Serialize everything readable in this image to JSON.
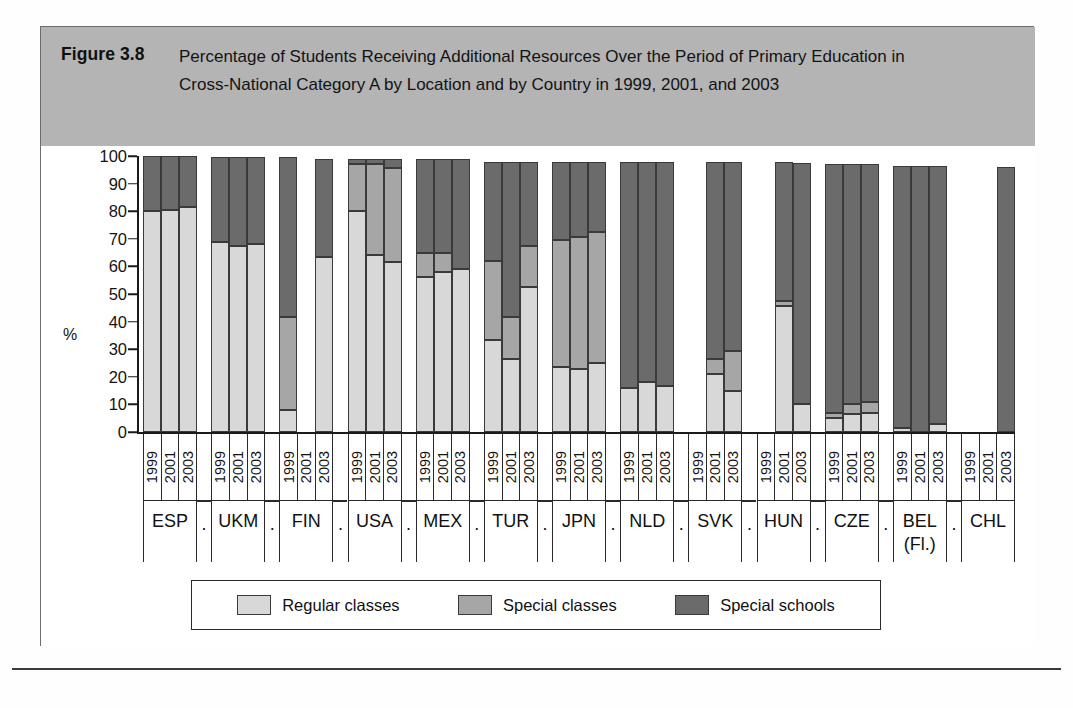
{
  "figure": {
    "number": "Figure 3.8",
    "title": "Percentage of Students Receiving Additional Resources Over the Period of Primary Education in Cross-National Category A by Location and by Country in 1999, 2001, and 2003",
    "y_axis_unit": "%"
  },
  "legend": {
    "items": [
      {
        "label": "Regular classes",
        "color": "#d8d8d8",
        "key": "regular"
      },
      {
        "label": "Special classes",
        "color": "#a6a6a6",
        "key": "special_classes"
      },
      {
        "label": "Special schools",
        "color": "#6b6b6b",
        "key": "special_schools"
      }
    ]
  },
  "spacer_label": ".",
  "chart_data": {
    "type": "bar",
    "subtype": "stacked-percentage",
    "title": "Percentage of Students Receiving Additional Resources Over the Period of Primary Education in Cross-National Category A by Location and by Country in 1999, 2001, and 2003",
    "xlabel": "",
    "ylabel": "%",
    "ylim": [
      0,
      100
    ],
    "yticks": [
      0,
      10,
      20,
      30,
      40,
      50,
      60,
      70,
      80,
      90,
      100
    ],
    "grid": false,
    "legend_position": "bottom",
    "years": [
      "1999",
      "2001",
      "2003"
    ],
    "series": [
      {
        "name": "Regular classes",
        "color": "#d8d8d8"
      },
      {
        "name": "Special classes",
        "color": "#a6a6a6"
      },
      {
        "name": "Special schools",
        "color": "#6b6b6b"
      }
    ],
    "categories": [
      "ESP",
      "UKM",
      "FIN",
      "USA",
      "MEX",
      "TUR",
      "JPN",
      "NLD",
      "SVK",
      "HUN",
      "CZE",
      "BEL (Fl.)",
      "CHL"
    ],
    "groups": [
      {
        "country": "ESP",
        "country_line1": "ESP",
        "country_line2": "",
        "bars": [
          {
            "year": "1999",
            "present": true,
            "regular": 80.0,
            "special_classes": 0.0,
            "special_schools": 20.0
          },
          {
            "year": "2001",
            "present": true,
            "regular": 80.5,
            "special_classes": 0.0,
            "special_schools": 19.5
          },
          {
            "year": "2003",
            "present": true,
            "regular": 81.5,
            "special_classes": 0.0,
            "special_schools": 18.5
          }
        ]
      },
      {
        "country": "UKM",
        "country_line1": "UKM",
        "country_line2": "",
        "bars": [
          {
            "year": "1999",
            "present": true,
            "regular": 69.0,
            "special_classes": 0.0,
            "special_schools": 30.5
          },
          {
            "year": "2001",
            "present": true,
            "regular": 67.5,
            "special_classes": 0.0,
            "special_schools": 32.0
          },
          {
            "year": "2003",
            "present": true,
            "regular": 68.0,
            "special_classes": 0.0,
            "special_schools": 31.5
          }
        ]
      },
      {
        "country": "FIN",
        "country_line1": "FIN",
        "country_line2": "",
        "bars": [
          {
            "year": "1999",
            "present": true,
            "regular": 8.0,
            "special_classes": 33.5,
            "special_schools": 58.0
          },
          {
            "year": "2001",
            "present": false,
            "regular": 0,
            "special_classes": 0,
            "special_schools": 0
          },
          {
            "year": "2003",
            "present": true,
            "regular": 63.5,
            "special_classes": 0.0,
            "special_schools": 35.5
          }
        ]
      },
      {
        "country": "USA",
        "country_line1": "USA",
        "country_line2": "",
        "bars": [
          {
            "year": "1999",
            "present": true,
            "regular": 80.0,
            "special_classes": 17.0,
            "special_schools": 2.0
          },
          {
            "year": "2001",
            "present": true,
            "regular": 64.0,
            "special_classes": 33.0,
            "special_schools": 2.0
          },
          {
            "year": "2003",
            "present": true,
            "regular": 61.5,
            "special_classes": 34.0,
            "special_schools": 3.5
          }
        ]
      },
      {
        "country": "MEX",
        "country_line1": "MEX",
        "country_line2": "",
        "bars": [
          {
            "year": "1999",
            "present": true,
            "regular": 56.0,
            "special_classes": 9.0,
            "special_schools": 34.0
          },
          {
            "year": "2001",
            "present": true,
            "regular": 58.0,
            "special_classes": 7.0,
            "special_schools": 34.0
          },
          {
            "year": "2003",
            "present": true,
            "regular": 59.0,
            "special_classes": 0.0,
            "special_schools": 40.0
          }
        ]
      },
      {
        "country": "TUR",
        "country_line1": "TUR",
        "country_line2": "",
        "bars": [
          {
            "year": "1999",
            "present": true,
            "regular": 33.5,
            "special_classes": 28.5,
            "special_schools": 36.0
          },
          {
            "year": "2001",
            "present": true,
            "regular": 26.5,
            "special_classes": 15.0,
            "special_schools": 56.5
          },
          {
            "year": "2003",
            "present": true,
            "regular": 52.5,
            "special_classes": 15.0,
            "special_schools": 30.5
          }
        ]
      },
      {
        "country": "JPN",
        "country_line1": "JPN",
        "country_line2": "",
        "bars": [
          {
            "year": "1999",
            "present": true,
            "regular": 23.5,
            "special_classes": 46.0,
            "special_schools": 28.5
          },
          {
            "year": "2001",
            "present": true,
            "regular": 23.0,
            "special_classes": 47.5,
            "special_schools": 27.5
          },
          {
            "year": "2003",
            "present": true,
            "regular": 25.0,
            "special_classes": 47.5,
            "special_schools": 25.5
          }
        ]
      },
      {
        "country": "NLD",
        "country_line1": "NLD",
        "country_line2": "",
        "bars": [
          {
            "year": "1999",
            "present": true,
            "regular": 16.0,
            "special_classes": 0.0,
            "special_schools": 82.0
          },
          {
            "year": "2001",
            "present": true,
            "regular": 18.0,
            "special_classes": 0.0,
            "special_schools": 80.0
          },
          {
            "year": "2003",
            "present": true,
            "regular": 16.5,
            "special_classes": 0.0,
            "special_schools": 81.5
          }
        ]
      },
      {
        "country": "SVK",
        "country_line1": "SVK",
        "country_line2": "",
        "bars": [
          {
            "year": "1999",
            "present": false,
            "regular": 0,
            "special_classes": 0,
            "special_schools": 0
          },
          {
            "year": "2001",
            "present": true,
            "regular": 21.0,
            "special_classes": 5.5,
            "special_schools": 71.5
          },
          {
            "year": "2003",
            "present": true,
            "regular": 15.0,
            "special_classes": 14.5,
            "special_schools": 68.5
          }
        ]
      },
      {
        "country": "HUN",
        "country_line1": "HUN",
        "country_line2": "",
        "bars": [
          {
            "year": "1999",
            "present": false,
            "regular": 0,
            "special_classes": 0,
            "special_schools": 0
          },
          {
            "year": "2001",
            "present": true,
            "regular": 45.5,
            "special_classes": 2.0,
            "special_schools": 50.5
          },
          {
            "year": "2003",
            "present": true,
            "regular": 10.0,
            "special_classes": 0.0,
            "special_schools": 87.5
          }
        ]
      },
      {
        "country": "CZE",
        "country_line1": "CZE",
        "country_line2": "",
        "bars": [
          {
            "year": "1999",
            "present": true,
            "regular": 5.0,
            "special_classes": 2.0,
            "special_schools": 90.0
          },
          {
            "year": "2001",
            "present": true,
            "regular": 6.5,
            "special_classes": 3.5,
            "special_schools": 87.0
          },
          {
            "year": "2003",
            "present": true,
            "regular": 7.0,
            "special_classes": 4.0,
            "special_schools": 86.0
          }
        ]
      },
      {
        "country": "BEL (Fl.)",
        "country_line1": "BEL",
        "country_line2": "(Fl.)",
        "bars": [
          {
            "year": "1999",
            "present": true,
            "regular": 1.5,
            "special_classes": 0.0,
            "special_schools": 95.0
          },
          {
            "year": "2001",
            "present": true,
            "regular": 0.0,
            "special_classes": 0.0,
            "special_schools": 96.5
          },
          {
            "year": "2003",
            "present": true,
            "regular": 3.0,
            "special_classes": 0.0,
            "special_schools": 93.5
          }
        ]
      },
      {
        "country": "CHL",
        "country_line1": "CHL",
        "country_line2": "",
        "bars": [
          {
            "year": "1999",
            "present": false,
            "regular": 0,
            "special_classes": 0,
            "special_schools": 0
          },
          {
            "year": "2001",
            "present": false,
            "regular": 0,
            "special_classes": 0,
            "special_schools": 0
          },
          {
            "year": "2003",
            "present": true,
            "regular": 0.0,
            "special_classes": 0.0,
            "special_schools": 96.0
          }
        ]
      }
    ]
  }
}
